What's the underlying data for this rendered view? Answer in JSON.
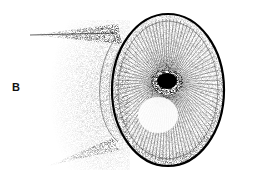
{
  "figure": {
    "panel_label": "B",
    "colors": {
      "ink": "#111111",
      "background": "#ffffff"
    }
  }
}
